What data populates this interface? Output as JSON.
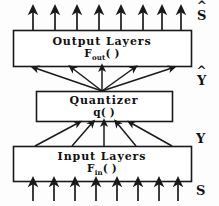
{
  "diagram": {
    "blocks": [
      {
        "id": "output-layers",
        "title": "Output  Layers",
        "fn_base": "F",
        "fn_sub": "out",
        "fn_tail": "( )"
      },
      {
        "id": "quantizer",
        "title": "Quantizer",
        "fn_base": "q",
        "fn_sub": "",
        "fn_tail": "( )"
      },
      {
        "id": "input-layers",
        "title": "Input  Layers",
        "fn_base": "F",
        "fn_sub": "in",
        "fn_tail": "( )"
      }
    ],
    "signals": [
      {
        "id": "s-hat",
        "base": "S",
        "hat": "^",
        "position": "top-right"
      },
      {
        "id": "y-hat",
        "base": "Y",
        "hat": "^",
        "position": "upper-middle-right"
      },
      {
        "id": "y",
        "base": "Y",
        "hat": "",
        "position": "lower-middle-right"
      },
      {
        "id": "s",
        "base": "S",
        "hat": "",
        "position": "bottom-right"
      }
    ],
    "arrow_groups": [
      {
        "id": "output-arrows",
        "count": 8,
        "direction": "up",
        "style": "parallel"
      },
      {
        "id": "quantizer-to-output-arrows",
        "count": 5,
        "direction": "up",
        "style": "fan-out"
      },
      {
        "id": "input-to-quantizer-arrows",
        "count": 5,
        "direction": "up",
        "style": "fan-in"
      },
      {
        "id": "input-arrows",
        "count": 8,
        "direction": "up",
        "style": "parallel"
      }
    ],
    "colors": {
      "stroke": "#1a1a1a",
      "background": "#fdfdfd",
      "box_fill": "#ffffff",
      "text": "#111111"
    }
  }
}
